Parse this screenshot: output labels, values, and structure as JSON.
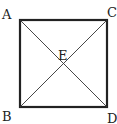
{
  "diagram": {
    "type": "geometry",
    "shape": "square with diagonals",
    "vertices": {
      "A": {
        "label": "A",
        "position": "top-left"
      },
      "C": {
        "label": "C",
        "position": "top-right"
      },
      "B": {
        "label": "B",
        "position": "bottom-left"
      },
      "D": {
        "label": "D",
        "position": "bottom-right"
      }
    },
    "intersection": {
      "label": "E",
      "position": "center"
    },
    "segments": [
      "AC",
      "CD",
      "DB",
      "BA",
      "AD",
      "CB"
    ],
    "colors": {
      "stroke": "#222222",
      "background": "#ffffff"
    }
  }
}
